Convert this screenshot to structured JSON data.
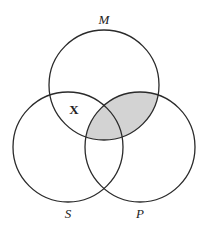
{
  "diagram": {
    "type": "venn-3",
    "colors": {
      "stroke": "#2a2a2a",
      "shade": "#d3d3d3",
      "background": "#ffffff"
    },
    "sets": [
      {
        "id": "M",
        "label": "M"
      },
      {
        "id": "S",
        "label": "S"
      },
      {
        "id": "P",
        "label": "P"
      }
    ],
    "shaded_region": "M ∩ P",
    "marks": [
      {
        "region": "M ∩ S only",
        "text": "X"
      }
    ]
  }
}
